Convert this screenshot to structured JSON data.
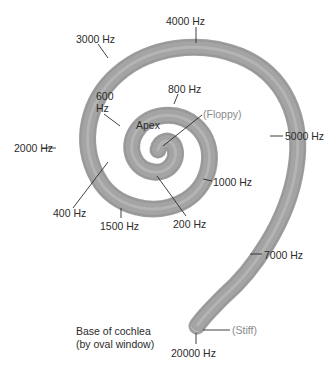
{
  "figure": {
    "colors": {
      "membrane_outer": "#a9a9a9",
      "membrane_inner": "#c8c8c8",
      "membrane_stripe": "#e2e2e2",
      "leader_line": "#2b2b2b",
      "label_text": "#2b2b2b",
      "property_text": "#8a8a8a"
    },
    "frequency_labels": [
      {
        "id": "f4000",
        "text": "4000 Hz"
      },
      {
        "id": "f3000",
        "text": "3000 Hz"
      },
      {
        "id": "f800",
        "text": "800 Hz"
      },
      {
        "id": "f600",
        "text": "600\nHz"
      },
      {
        "id": "f5000",
        "text": "5000 Hz"
      },
      {
        "id": "f2000",
        "text": "2000 Hz"
      },
      {
        "id": "f1000",
        "text": "1000 Hz"
      },
      {
        "id": "f400",
        "text": "400 Hz"
      },
      {
        "id": "f200",
        "text": "200 Hz"
      },
      {
        "id": "f1500",
        "text": "1500 Hz"
      },
      {
        "id": "f7000",
        "text": "7000 Hz"
      },
      {
        "id": "f20000",
        "text": "20000 Hz"
      }
    ],
    "structure_labels": {
      "apex": "Apex",
      "base_line1": "Base of cochlea",
      "base_line2": "(by oval window)"
    },
    "property_labels": {
      "floppy": "(Floppy)",
      "stiff": "(Stiff)"
    }
  }
}
